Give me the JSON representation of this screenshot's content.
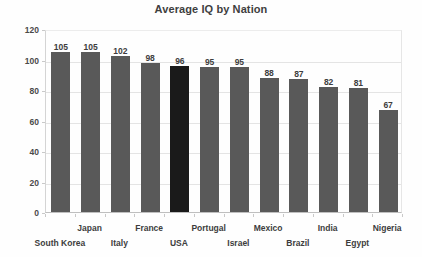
{
  "chart_data": {
    "type": "bar",
    "title": "Average IQ by Nation",
    "xlabel": "",
    "ylabel": "",
    "categories": [
      "South Korea",
      "Japan",
      "Italy",
      "France",
      "USA",
      "Portugal",
      "Israel",
      "Mexico",
      "Brazil",
      "India",
      "Egypt",
      "Nigeria"
    ],
    "values": [
      105,
      105,
      102,
      98,
      96,
      95,
      95,
      88,
      87,
      82,
      81,
      67
    ],
    "ylim": [
      0,
      120
    ],
    "ytick_values": [
      0,
      20,
      40,
      60,
      80,
      100,
      120
    ],
    "ytick_labels": [
      "0",
      "20",
      "40",
      "60",
      "80",
      "100",
      "120"
    ],
    "value_labels": [
      "105",
      "105",
      "102",
      "98",
      "96",
      "95",
      "95",
      "88",
      "87",
      "82",
      "81",
      "67"
    ],
    "grid": true,
    "legend": false,
    "highlight_index": 4,
    "colors": {
      "bar": "#595959",
      "bar_highlight": "#1a1a1a",
      "gridline": "#e4e4e4",
      "axis": "#bfbfbf",
      "text": "#3d3d3d",
      "title": "#3f3f3f",
      "background": "#fefefe"
    }
  }
}
